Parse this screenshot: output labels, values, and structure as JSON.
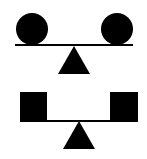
{
  "diagram": {
    "colors": {
      "fill": "#000000",
      "background": "#ffffff"
    },
    "scales": [
      {
        "id": "top",
        "shape": "circle",
        "count": 2,
        "balanced": true
      },
      {
        "id": "bottom",
        "shape": "square",
        "count": 2,
        "balanced": true
      }
    ]
  }
}
